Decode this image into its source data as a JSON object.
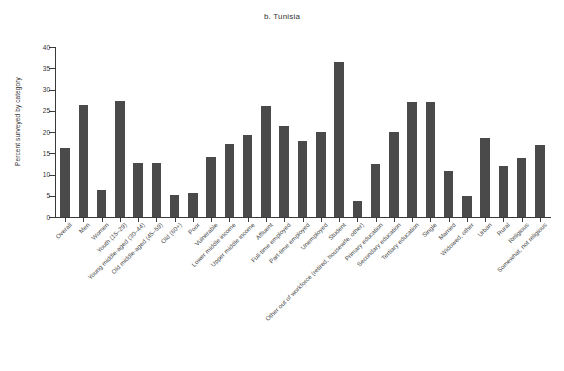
{
  "chart_data": {
    "type": "bar",
    "title": "b. Tunisia",
    "xlabel": "",
    "ylabel": "Percent surveyed by category",
    "ylim": [
      0,
      40
    ],
    "yticks": [
      0,
      5,
      10,
      15,
      20,
      25,
      30,
      35,
      40
    ],
    "grid": false,
    "legend": null,
    "bar_color": "#4a4a4a",
    "categories": [
      "Overall",
      "Men",
      "Women",
      "Youth (15–29)",
      "Young middle-aged (30–44)",
      "Old middle-aged (45–59)",
      "Old (60+)",
      "Poor",
      "Vulnerable",
      "Lower middle income",
      "Upper middle income",
      "Affluent",
      "Full-time employed",
      "Part-time employed",
      "Unemployed",
      "Student",
      "Other out of workforce (retired, housewife, other)",
      "Primary education",
      "Secondary education",
      "Tertiary education",
      "Single",
      "Married",
      "Widowed, other",
      "Urban",
      "Rural",
      "Religious",
      "Somewhat, not religious"
    ],
    "values": [
      16.2,
      26.3,
      6.4,
      27.2,
      12.8,
      12.8,
      5.2,
      5.6,
      14.2,
      17.1,
      19.2,
      26.1,
      21.3,
      17.8,
      20.1,
      36.5,
      3.7,
      12.4,
      20.1,
      27.1,
      27.1,
      10.8,
      4.9,
      18.7,
      11.9,
      14.0,
      16.9
    ]
  }
}
